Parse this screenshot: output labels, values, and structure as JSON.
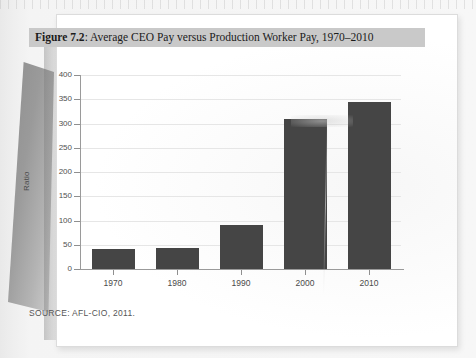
{
  "figure": {
    "number_label": "Figure 7.2",
    "separator": ": ",
    "title_text": "Average CEO Pay versus Production Worker Pay, 1970–2010",
    "source_note": "SOURCE: AFL-CIO, 2011.",
    "caption_band_color": "#c9c9c9",
    "bar_color": "#454545",
    "gridline_color": "#e6e6e6",
    "page_color": "#ffffff"
  },
  "chart_data": {
    "type": "bar",
    "title": "Average CEO Pay versus Production Worker Pay, 1970–2010",
    "categories": [
      "1970",
      "1980",
      "1990",
      "2000",
      "2010"
    ],
    "values": [
      41,
      44,
      91,
      309,
      344
    ],
    "xlabel": "",
    "ylabel": "Ratio",
    "ylim": [
      0,
      400
    ],
    "ytick_labels": [
      "0",
      "50",
      "100",
      "150",
      "200",
      "250",
      "300",
      "350",
      "400"
    ],
    "ytick_values": [
      0,
      50,
      100,
      150,
      200,
      250,
      300,
      350,
      400
    ],
    "grid": true,
    "legend": false,
    "series": [
      {
        "name": "Ratio of CEO pay to production worker pay",
        "values": [
          41,
          44,
          91,
          309,
          344
        ]
      }
    ]
  }
}
